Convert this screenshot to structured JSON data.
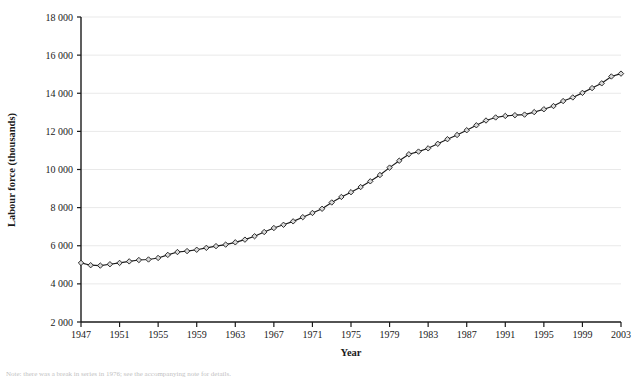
{
  "chart_data": {
    "type": "line",
    "title": "",
    "xlabel": "Year",
    "ylabel": "Labour force (thousands)",
    "xlim": [
      1947,
      2003
    ],
    "ylim": [
      2000,
      18000
    ],
    "grid": "horizontal",
    "legend": "none",
    "marker": "open-diamond",
    "line_color": "#1a1a1a",
    "marker_fill": "#d9d9d9",
    "grid_color": "#e9e9e9",
    "axis_color": "#1a1a1a",
    "y_ticks": [
      2000,
      4000,
      6000,
      8000,
      10000,
      12000,
      14000,
      16000,
      18000
    ],
    "y_tick_labels": [
      "2 000",
      "4 000",
      "6 000",
      "8 000",
      "10 000",
      "12 000",
      "14 000",
      "16 000",
      "18 000"
    ],
    "x_ticks": [
      1947,
      1951,
      1955,
      1959,
      1963,
      1967,
      1971,
      1975,
      1979,
      1983,
      1987,
      1991,
      1995,
      1999,
      2003
    ],
    "x_tick_labels": [
      "1947",
      "1951",
      "1955",
      "1959",
      "1963",
      "1967",
      "1971",
      "1975",
      "1979",
      "1983",
      "1987",
      "1991",
      "1995",
      "1999",
      "2003"
    ],
    "x": [
      1947,
      1948,
      1949,
      1950,
      1951,
      1952,
      1953,
      1954,
      1955,
      1956,
      1957,
      1958,
      1959,
      1960,
      1961,
      1962,
      1963,
      1964,
      1965,
      1966,
      1967,
      1968,
      1969,
      1970,
      1971,
      1972,
      1973,
      1974,
      1975,
      1976,
      1977,
      1978,
      1979,
      1980,
      1981,
      1982,
      1983,
      1984,
      1985,
      1986,
      1987,
      1988,
      1989,
      1990,
      1991,
      1992,
      1993,
      1994,
      1995,
      1996,
      1997,
      1998,
      1999,
      2000,
      2001,
      2002,
      2003
    ],
    "values": [
      5100,
      4980,
      4960,
      5030,
      5100,
      5180,
      5250,
      5280,
      5360,
      5520,
      5670,
      5720,
      5790,
      5890,
      5980,
      6060,
      6180,
      6320,
      6500,
      6720,
      6930,
      7100,
      7280,
      7500,
      7720,
      7940,
      8270,
      8560,
      8810,
      9080,
      9380,
      9710,
      10100,
      10460,
      10800,
      10940,
      11110,
      11350,
      11590,
      11810,
      12060,
      12320,
      12570,
      12730,
      12810,
      12850,
      12880,
      13010,
      13160,
      13330,
      13590,
      13780,
      14020,
      14270,
      14520,
      14880,
      15030
    ],
    "series_name": "Labour force"
  },
  "footnote": "Note: there was a break in series in 1976; see the accompanying note for details.",
  "plot": {
    "x0": 81,
    "x1": 621,
    "y0": 322,
    "y1": 17
  }
}
